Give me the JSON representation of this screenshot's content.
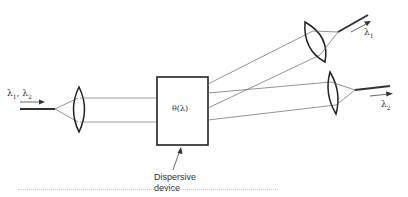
{
  "diagram": {
    "type": "optical-demultiplexer",
    "input": {
      "label_main": "λ",
      "label_subs": [
        "1",
        "2"
      ],
      "label_text": "λ1, λ2"
    },
    "device": {
      "label": "θ(λ)",
      "annotation": [
        "Dispersive",
        "device"
      ]
    },
    "outputs": [
      {
        "label_main": "λ",
        "label_sub": "1",
        "label_text": "λ1"
      },
      {
        "label_main": "λ",
        "label_sub": "2",
        "label_text": "λ2"
      }
    ],
    "colors": {
      "line": "#333333",
      "thin_line": "#6a6a6a",
      "background": "#ffffff"
    }
  }
}
